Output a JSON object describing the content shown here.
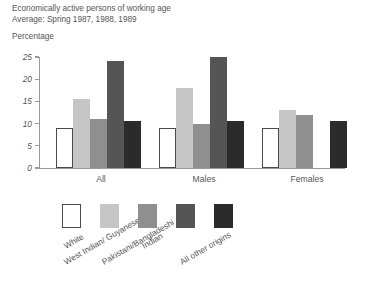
{
  "header": {
    "title_line1": "Economically active persons of working age",
    "title_line2": "Average: Spring 1987, 1988, 1989",
    "axis_title": "Percentage"
  },
  "chart_data": {
    "type": "bar",
    "title": "Economically active persons of working age",
    "subtitle": "Average: Spring 1987, 1988, 1989",
    "xlabel": "",
    "ylabel": "Percentage",
    "ylim": [
      0,
      25
    ],
    "yticks": [
      0,
      5,
      10,
      15,
      20,
      25
    ],
    "ytick_labels": [
      "0",
      "5",
      "10",
      "15",
      "20",
      "25"
    ],
    "grid": false,
    "legend_position": "bottom",
    "categories": [
      "All",
      "Males",
      "Females"
    ],
    "series": [
      {
        "name": "White",
        "color": "#ffffff",
        "border": "#4a4a4a",
        "values": [
          9,
          9,
          9
        ]
      },
      {
        "name": "West Indian/ Guyanese",
        "color": "#c6c6c6",
        "border": "#c6c6c6",
        "values": [
          15.5,
          18,
          13
        ]
      },
      {
        "name": "Indian",
        "color": "#8f8f8f",
        "border": "#8f8f8f",
        "values": [
          11,
          10,
          12
        ]
      },
      {
        "name": "Pakistani/Bangladeshi",
        "color": "#555555",
        "border": "#555555",
        "values": [
          24,
          25,
          0
        ]
      },
      {
        "name": "All other origins",
        "color": "#2b2b2b",
        "border": "#2b2b2b",
        "values": [
          10.5,
          10.5,
          10.5
        ]
      }
    ]
  }
}
